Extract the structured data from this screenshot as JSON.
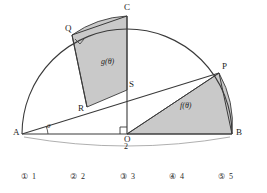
{
  "figure": {
    "type": "geometry-diagram",
    "points": {
      "A": {
        "label": "A",
        "x": 22,
        "y": 134
      },
      "B": {
        "label": "B",
        "x": 232,
        "y": 134
      },
      "O": {
        "label": "O",
        "x": 127,
        "y": 134
      },
      "C": {
        "label": "C",
        "x": 127,
        "y": 16
      },
      "P": {
        "label": "P",
        "x": 219,
        "y": 73
      },
      "Q": {
        "label": "Q",
        "x": 72,
        "y": 35
      },
      "R": {
        "label": "R",
        "x": 87,
        "y": 107
      },
      "S": {
        "label": "S",
        "x": 127,
        "y": 90
      }
    },
    "angle_label": "θ",
    "dimension_label": "2",
    "regions": [
      {
        "name": "f-region",
        "label": "f(θ)",
        "fill": "#c9c9c9"
      },
      {
        "name": "g-region",
        "label": "g(θ)",
        "fill": "#c9c9c9"
      }
    ],
    "colors": {
      "stroke": "#3a3a3a",
      "light_stroke": "#9a9a9a",
      "shade": "#c9c9c9",
      "background": "#ffffff"
    }
  },
  "choices": [
    {
      "marker": "①",
      "value": "1"
    },
    {
      "marker": "②",
      "value": "2"
    },
    {
      "marker": "③",
      "value": "3"
    },
    {
      "marker": "④",
      "value": "4"
    },
    {
      "marker": "⑤",
      "value": "5"
    }
  ]
}
